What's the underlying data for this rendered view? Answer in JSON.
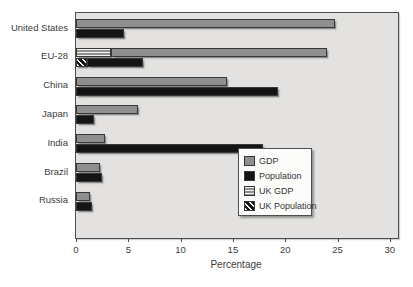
{
  "colors": {
    "gdp_bar": "#908f8d",
    "population_bar": "#141414",
    "plot_background": "#e3e2e0",
    "plot_border": "#4d4d4d",
    "text": "#3c3c3c",
    "legend_background": "#fcfcfb"
  },
  "chart_data": {
    "type": "bar",
    "orientation": "horizontal",
    "title": "",
    "xlabel": "Percentage",
    "ylabel": "",
    "xlim": [
      0,
      30
    ],
    "xticks": [
      0,
      5,
      10,
      15,
      20,
      25,
      30
    ],
    "grid": false,
    "categories": [
      "United States",
      "EU-28",
      "China",
      "Japan",
      "India",
      "Brazil",
      "Russia"
    ],
    "series": [
      {
        "name": "GDP",
        "values": [
          24.8,
          24.0,
          14.4,
          5.9,
          2.8,
          2.3,
          1.3
        ]
      },
      {
        "name": "Population",
        "values": [
          4.6,
          6.4,
          19.3,
          1.7,
          17.9,
          2.5,
          1.5
        ]
      },
      {
        "name": "UK GDP",
        "values": [
          null,
          3.3,
          null,
          null,
          null,
          null,
          null
        ]
      },
      {
        "name": "UK Population",
        "values": [
          null,
          1.0,
          null,
          null,
          null,
          null,
          null
        ]
      }
    ],
    "legend": {
      "position": "lower right",
      "entries": [
        "GDP",
        "Population",
        "UK GDP",
        "UK Population"
      ]
    }
  }
}
